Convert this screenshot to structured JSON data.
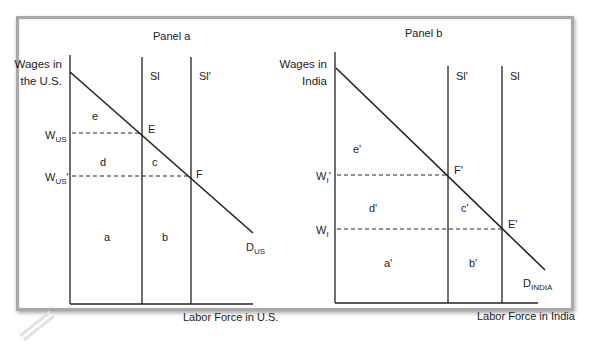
{
  "panels": [
    {
      "title": "Panel a",
      "y_axis_label_line1": "Wages in",
      "y_axis_label_line2": "the U.S.",
      "x_axis_label": "Labor Force in U.S.",
      "supply_lines": [
        {
          "label": "Sl",
          "role": "original supply"
        },
        {
          "label": "Sl'",
          "role": "shifted supply"
        }
      ],
      "demand_label_main": "D",
      "demand_label_sub": "US",
      "wage_levels": [
        {
          "main": "W",
          "sub": "US",
          "prime": ""
        },
        {
          "main": "W",
          "sub": "US",
          "prime": "'"
        }
      ],
      "points": [
        "E",
        "F"
      ],
      "areas": [
        "e",
        "d",
        "c",
        "a",
        "b"
      ]
    },
    {
      "title": "Panel b",
      "y_axis_label_line1": "Wages in",
      "y_axis_label_line2": "India",
      "x_axis_label": "Labor Force in India",
      "supply_lines": [
        {
          "label": "Sl'",
          "role": "shifted supply"
        },
        {
          "label": "Sl",
          "role": "original supply"
        }
      ],
      "demand_label_main": "D",
      "demand_label_sub": "INDIA",
      "wage_levels": [
        {
          "main": "W",
          "sub": "I",
          "prime": "'"
        },
        {
          "main": "W",
          "sub": "I",
          "prime": ""
        }
      ],
      "points": [
        "F'",
        "E'"
      ],
      "areas": [
        "e'",
        "d'",
        "c'",
        "a'",
        "b'"
      ]
    }
  ],
  "colors": {
    "line": "#222222",
    "frame_border": "#a9a9a9",
    "background": "#ffffff"
  }
}
